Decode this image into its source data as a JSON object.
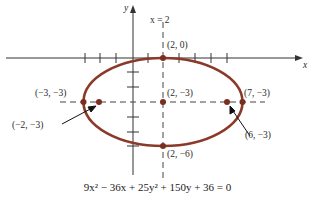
{
  "diagram": {
    "axes": {
      "x_label": "x",
      "y_label": "y"
    },
    "axis_line_label": "x = 2",
    "equation": "9x² − 36x + 25y² + 150y + 36 = 0",
    "colors": {
      "ellipse": "#8b3a2a",
      "axis": "#333333",
      "dashed": "#444444",
      "point": "#7a2e22"
    },
    "points": {
      "top_vertex": "(2, 0)",
      "center": "(2, −3)",
      "bottom_vertex": "(2, −6)",
      "left_vertex": "(−3, −3)",
      "right_vertex": "(7, −3)",
      "left_focus": "(−2, −3)",
      "right_focus": "(6, −3)"
    }
  }
}
